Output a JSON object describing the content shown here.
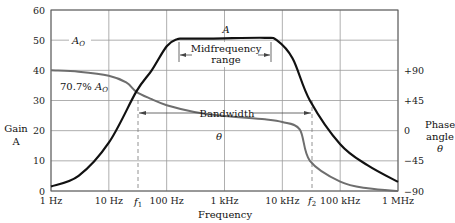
{
  "chart_data": {
    "type": "line",
    "title": "",
    "xlabel": "Frequency",
    "ylabel_left": "Gain A",
    "ylabel_right": "Phase angle θ",
    "x_scale": "log",
    "x_ticks": [
      "1 Hz",
      "10 Hz",
      "100 Hz",
      "1 kHz",
      "10 kHz",
      "100 kHz",
      "1 MHz"
    ],
    "x_tick_values_hz": [
      1,
      10,
      100,
      1000,
      10000,
      100000,
      1000000
    ],
    "y_left_ticks": [
      0,
      10,
      20,
      30,
      40,
      50,
      60
    ],
    "ylim_left": [
      0,
      60
    ],
    "y_right_ticks": [
      "+90",
      "+45",
      "0",
      "−45",
      "−90"
    ],
    "y_right_tick_values": [
      90,
      45,
      0,
      -45,
      -90
    ],
    "grid": true,
    "series": [
      {
        "name": "A",
        "axis": "left",
        "color": "#111111",
        "x_hz": [
          1,
          3,
          10,
          30,
          55,
          100,
          150,
          200,
          500,
          1000,
          5000,
          8000,
          15000,
          30000,
          100000,
          300000,
          1000000
        ],
        "values": [
          1.5,
          5,
          16,
          33,
          40,
          48,
          50.3,
          50.5,
          50.5,
          50.6,
          50.8,
          50,
          44,
          30,
          15.5,
          8.5,
          3
        ]
      },
      {
        "name": "θ",
        "axis": "right",
        "color": "#6e6e6e",
        "x_hz": [
          1,
          3,
          10,
          20,
          30,
          55,
          100,
          300,
          1000,
          5000,
          10000,
          20000,
          30000,
          100000,
          300000,
          1000000
        ],
        "values": [
          90,
          88,
          82,
          72,
          58,
          47,
          38,
          28,
          22,
          17,
          13,
          2,
          -45,
          -76,
          -86,
          -90
        ]
      }
    ],
    "annotations": [
      {
        "text": "A",
        "x_hz": 1000,
        "y": 52.5
      },
      {
        "text": "A_O",
        "x_hz": 2.5,
        "y": 50
      },
      {
        "text": "70.7% A_O",
        "x_hz": 2.5,
        "y": 35
      },
      {
        "text": "Midfrequency range",
        "x_hz": [
          200,
          8000
        ],
        "y": 46
      },
      {
        "text": "Bandwidth",
        "x_hz": [
          30,
          25000
        ],
        "y": 26
      },
      {
        "text": "θ",
        "x_hz": 1000,
        "y": 17
      },
      {
        "text": "f1",
        "x_hz": 30
      },
      {
        "text": "f2",
        "x_hz": 30000
      }
    ]
  },
  "labels": {
    "gain_line1": "Gain",
    "gain_line2": "A",
    "phase_line1": "Phase",
    "phase_line2": "angle",
    "phase_line3": "θ",
    "frequency": "Frequency",
    "a_curve": "A",
    "a_o": "A",
    "a_o_sub": "O",
    "pct_prefix": "70.7% ",
    "pct_a": "A",
    "pct_sub": "O",
    "mid1": "Midfrequency",
    "mid2": "range",
    "bandwidth": "Bandwidth",
    "theta": "θ",
    "f1": "f",
    "f1_sub": "1",
    "f2": "f",
    "f2_sub": "2"
  }
}
